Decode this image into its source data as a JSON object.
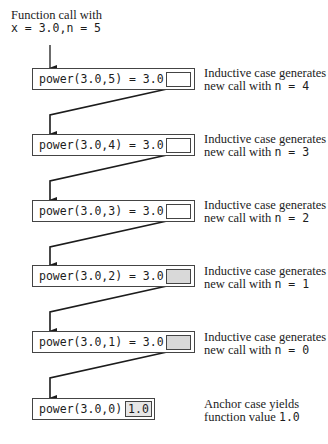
{
  "intro": {
    "line1": "Function call with",
    "line2": "x = 3.0,n = 5"
  },
  "calls": [
    {
      "expr": "power(3.0,5) = 3.0 *",
      "note_line1": "Inductive case generates",
      "note_line2_prefix": "new call with ",
      "note_n": "n = 4",
      "slot_shaded": false
    },
    {
      "expr": "power(3.0,4) = 3.0 *",
      "note_line1": "Inductive case generates",
      "note_line2_prefix": "new call with ",
      "note_n": "n = 3",
      "slot_shaded": false
    },
    {
      "expr": "power(3.0,3) = 3.0 *",
      "note_line1": "Inductive case generates",
      "note_line2_prefix": "new call with ",
      "note_n": "n = 2",
      "slot_shaded": false
    },
    {
      "expr": "power(3.0,2) = 3.0 *",
      "note_line1": "Inductive case generates",
      "note_line2_prefix": "new call with ",
      "note_n": "n = 1",
      "slot_shaded": true
    },
    {
      "expr": "power(3.0,1) = 3.0 *",
      "note_line1": "Inductive case generates",
      "note_line2_prefix": "new call with ",
      "note_n": "n = 0",
      "slot_shaded": true
    }
  ],
  "anchor": {
    "expr": "power(3.0,0) =",
    "value": "1.0",
    "note_line1": "Anchor case yields",
    "note_line2_prefix": "function value ",
    "note_value": "1.0"
  }
}
